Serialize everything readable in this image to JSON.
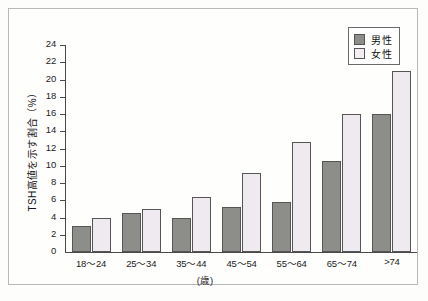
{
  "chart_data": {
    "type": "bar",
    "title": "",
    "subtitle": "",
    "xlabel": "(歳)",
    "ylabel": "TSH高値を示す割合（%）",
    "categories": [
      "18〜24",
      "25〜34",
      "35〜44",
      "45〜54",
      "55〜64",
      "65〜74",
      ">74"
    ],
    "series": [
      {
        "name": "男性",
        "color": "#8d8d8a",
        "values": [
          3.0,
          4.5,
          4.0,
          5.2,
          5.8,
          10.5,
          16.0
        ]
      },
      {
        "name": "女性",
        "color": "#efeaf0",
        "values": [
          4.0,
          5.0,
          6.4,
          9.2,
          12.8,
          16.0,
          21.0
        ]
      }
    ],
    "ylim": [
      0,
      24
    ],
    "ytick_step": 2,
    "yticks": [
      "24",
      "22",
      "20",
      "18",
      "16",
      "14",
      "12",
      "10",
      "8",
      "6",
      "4",
      "2",
      "0"
    ],
    "grid": false,
    "legend_position": "top-right"
  },
  "legend": {
    "entries": [
      {
        "label": "男性",
        "swatch": "male-swatch"
      },
      {
        "label": "女性",
        "swatch": "female-swatch"
      }
    ]
  },
  "axes": {
    "y_title": "TSH高値を示す割合（%）",
    "x_title": "(歳)"
  }
}
